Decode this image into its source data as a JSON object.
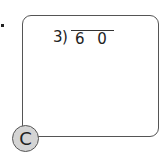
{
  "problem": {
    "divisor": "3",
    "dividend": "6 0",
    "expression": "3)60"
  },
  "option": {
    "label": "C"
  }
}
